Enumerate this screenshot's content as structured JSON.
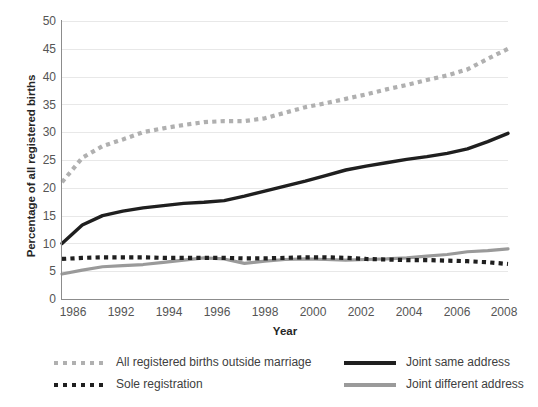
{
  "chart_data": {
    "type": "line",
    "title": "",
    "xlabel": "Year",
    "ylabel": "Percentage of all registered births",
    "xlim": [
      1986,
      2008
    ],
    "ylim": [
      0,
      50
    ],
    "grid": true,
    "legend_position": "bottom",
    "y_ticks": [
      50,
      45,
      40,
      35,
      30,
      25,
      20,
      15,
      10,
      5,
      0
    ],
    "x_ticks": [
      "1986",
      "1992",
      "1994",
      "1996",
      "1998",
      "2000",
      "2002",
      "2004",
      "2006",
      "2008"
    ],
    "x": [
      1986,
      1987,
      1988,
      1989,
      1990,
      1991,
      1992,
      1993,
      1994,
      1995,
      1996,
      1997,
      1998,
      1999,
      2000,
      2001,
      2002,
      2003,
      2004,
      2005,
      2006,
      2007,
      2008
    ],
    "series": [
      {
        "name": "All registered births outside marriage",
        "style": "dotted",
        "color": "#b0b0b0",
        "values": [
          21.0,
          25.4,
          27.5,
          28.7,
          30.0,
          30.7,
          31.3,
          31.8,
          32.0,
          32.0,
          32.5,
          33.5,
          34.5,
          35.2,
          36.0,
          36.8,
          37.7,
          38.5,
          39.4,
          40.2,
          41.3,
          43.2,
          45.0
        ]
      },
      {
        "name": "Joint same address",
        "style": "solid",
        "color": "#1f1f1f",
        "values": [
          10.0,
          13.3,
          15.0,
          15.8,
          16.4,
          16.8,
          17.2,
          17.4,
          17.7,
          18.5,
          19.4,
          20.3,
          21.2,
          22.2,
          23.2,
          23.9,
          24.5,
          25.1,
          25.6,
          26.2,
          27.0,
          28.3,
          29.8
        ]
      },
      {
        "name": "Sole registration",
        "style": "dotted",
        "color": "#1f1f1f",
        "values": [
          7.2,
          7.4,
          7.5,
          7.5,
          7.5,
          7.4,
          7.4,
          7.4,
          7.4,
          7.3,
          7.3,
          7.4,
          7.5,
          7.5,
          7.4,
          7.2,
          7.1,
          7.0,
          7.0,
          6.9,
          6.8,
          6.6,
          6.3
        ]
      },
      {
        "name": "Joint different address",
        "style": "solid",
        "color": "#9a9a9a",
        "values": [
          4.5,
          5.2,
          5.8,
          6.0,
          6.2,
          6.6,
          7.0,
          7.4,
          7.2,
          6.4,
          6.8,
          7.1,
          7.2,
          7.1,
          7.0,
          7.1,
          7.2,
          7.4,
          7.7,
          8.0,
          8.5,
          8.7,
          9.0
        ]
      }
    ],
    "legend": [
      {
        "label": "All registered births outside marriage",
        "style": "dotted",
        "color": "#b0b0b0"
      },
      {
        "label": "Sole registration",
        "style": "dotted",
        "color": "#1f1f1f"
      },
      {
        "label": "Joint same address",
        "style": "solid",
        "color": "#1f1f1f"
      },
      {
        "label": "Joint different address",
        "style": "solid",
        "color": "#9a9a9a"
      }
    ]
  }
}
